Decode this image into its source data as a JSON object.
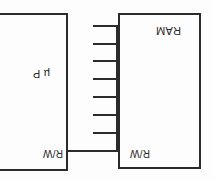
{
  "page": {
    "orientation": "upside-down",
    "ink_color": "#2b2b2b",
    "paper_color": "#fdfdfd"
  },
  "diagram": {
    "type": "block-diagram",
    "blocks": [
      {
        "id": "ram",
        "label": "RAM",
        "pin_labels": [
          "R/W"
        ]
      },
      {
        "id": "microprocessor",
        "label": "µ P",
        "pin_labels": [
          "R/W"
        ]
      }
    ],
    "connections": {
      "rw_line_label": "R/W",
      "bus_stub_count": 7
    }
  }
}
